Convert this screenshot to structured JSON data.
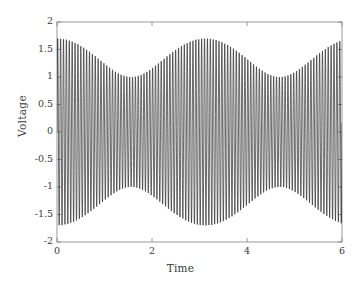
{
  "chart_data": {
    "type": "line",
    "title": "",
    "xlabel": "Time",
    "ylabel": "Voltage",
    "x_exponent_label": "×10",
    "x_exponent_value": "-5",
    "xlim": [
      0,
      6e-05
    ],
    "ylim": [
      -2,
      2
    ],
    "xticks": [
      0,
      2e-05,
      4e-05,
      6e-05
    ],
    "xticklabels": [
      "0",
      "2",
      "4",
      "6"
    ],
    "yticks": [
      -2,
      -1.5,
      -1,
      -0.5,
      0,
      0.5,
      1,
      1.5,
      2
    ],
    "yticklabels": [
      "-2",
      "-1.5",
      "-1",
      "-0.5",
      "0",
      "0.5",
      "1",
      "1.5",
      "2"
    ],
    "grid": false,
    "legend": null,
    "line_color": "#2b2b2b",
    "line_width": 0.7,
    "background": "#ffffff",
    "axis_color": "#808080",
    "model": {
      "form": "A1*sin(2*pi*f1*t) + A2*sin(2*pi*f2*t)",
      "A1": 1.35,
      "A2": 0.35,
      "f1": 1650000,
      "f2": 1618000,
      "beat_frequency": 32000,
      "beat_period": 3.125e-05,
      "samples": 4000
    },
    "envelope_max": 1.7,
    "envelope_min": 1.0,
    "envelope_peak_times": [
      1e-05,
      4.1e-05
    ],
    "envelope_trough_times": [
      2.7e-05
    ],
    "value_at_t0": 1.35
  },
  "figure": {
    "plot_box": {
      "left": 57,
      "top": 22,
      "right": 342,
      "bottom": 242
    }
  }
}
